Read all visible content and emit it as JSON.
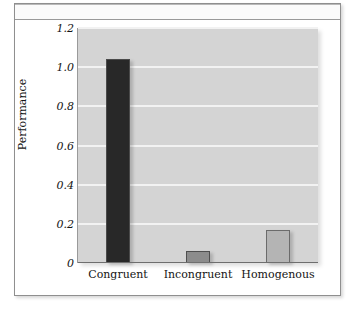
{
  "figure": {
    "frame_border_color": "#8f8f8f",
    "plot_background": "#d4d4d4",
    "gridline_color": "#f2f2f2"
  },
  "chart_data": {
    "type": "bar",
    "title": "",
    "subtitle": "",
    "xlabel": "",
    "ylabel": "Performance",
    "categories": [
      "Congruent",
      "Incongruent",
      "Homogenous"
    ],
    "values": [
      1.04,
      0.06,
      0.17
    ],
    "bar_colors": [
      "#282828",
      "#8c8c8c",
      "#b4b4b4"
    ],
    "bar_edge_colors": [
      "#4a4a4a",
      "#4f4f4f",
      "#6b6b6b"
    ],
    "ylim": [
      0,
      1.2
    ],
    "yticks": [
      1.2,
      1.0,
      0.8,
      0.6,
      0.4,
      0.2,
      0
    ],
    "ytick_labels": [
      "1.2",
      "1.0",
      "0.8",
      "0.6",
      "0.4",
      "0.2",
      "0"
    ],
    "grid": true,
    "grid_axis": "y",
    "legend": false,
    "legend_position": "none",
    "annotations": []
  }
}
